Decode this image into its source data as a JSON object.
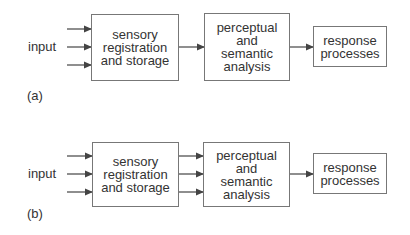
{
  "diagrams": [
    {
      "id": "a",
      "caption": "(a)",
      "input_label": "input",
      "boxes": [
        {
          "lines": [
            "sensory",
            "registration",
            "and storage"
          ]
        },
        {
          "lines": [
            "perceptual",
            "and",
            "semantic",
            "analysis"
          ]
        },
        {
          "lines": [
            "response",
            "processes"
          ]
        }
      ],
      "connections": {
        "input_to_box1": 3,
        "box1_to_box2": 1,
        "box2_to_box3": 1
      }
    },
    {
      "id": "b",
      "caption": "(b)",
      "input_label": "input",
      "boxes": [
        {
          "lines": [
            "sensory",
            "registration",
            "and storage"
          ]
        },
        {
          "lines": [
            "perceptual",
            "and",
            "semantic",
            "analysis"
          ]
        },
        {
          "lines": [
            "response",
            "processes"
          ]
        }
      ],
      "connections": {
        "input_to_box1": 3,
        "box1_to_box2": 3,
        "box2_to_box3": 1
      }
    }
  ],
  "colors": {
    "line": "#444444",
    "box_border": "#777777",
    "text": "#333333"
  }
}
